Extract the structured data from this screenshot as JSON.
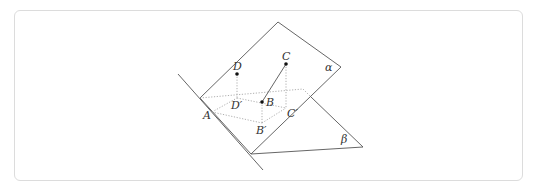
{
  "diagram": {
    "type": "solid-geometry",
    "planes": [
      {
        "id": "alpha",
        "label": "α"
      },
      {
        "id": "beta",
        "label": "β"
      }
    ],
    "points": [
      {
        "id": "A",
        "label": "A"
      },
      {
        "id": "B",
        "label": "B"
      },
      {
        "id": "C",
        "label": "C"
      },
      {
        "id": "D",
        "label": "D"
      },
      {
        "id": "B_prime",
        "label": "B′"
      },
      {
        "id": "C_prime",
        "label": "C′"
      },
      {
        "id": "D_prime",
        "label": "D′"
      }
    ],
    "segments": [
      {
        "from": "B",
        "to": "C",
        "style": "solid"
      },
      {
        "from": "D",
        "to": "D_prime",
        "style": "dotted"
      },
      {
        "from": "C",
        "to": "C_prime",
        "style": "dotted"
      },
      {
        "from": "B",
        "to": "B_prime",
        "style": "dotted"
      },
      {
        "from": "A",
        "to": "D_prime",
        "style": "dotted"
      },
      {
        "from": "D_prime",
        "to": "C_prime",
        "style": "dotted"
      },
      {
        "from": "A",
        "to": "B_prime",
        "style": "dotted"
      },
      {
        "from": "B_prime",
        "to": "C_prime",
        "style": "dotted"
      }
    ],
    "colors": {
      "line": "#555555",
      "hidden_line": "#9a9a9a",
      "point": "#111111",
      "frame_border": "#dcdcdc"
    }
  }
}
